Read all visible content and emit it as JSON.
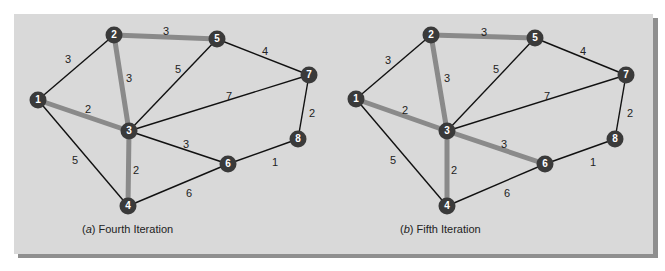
{
  "colors": {
    "panel": "#d9d9d9",
    "tree_edge": "#8a8a8a",
    "edge": "#111111",
    "node": "#3a3a3a"
  },
  "graphs": [
    {
      "caption_letter": "a",
      "caption_text": "Fourth Iteration",
      "nodes": [
        {
          "id": "1",
          "x": 38,
          "y": 100
        },
        {
          "id": "2",
          "x": 114,
          "y": 35
        },
        {
          "id": "3",
          "x": 129,
          "y": 131
        },
        {
          "id": "4",
          "x": 128,
          "y": 206
        },
        {
          "id": "5",
          "x": 217,
          "y": 39
        },
        {
          "id": "6",
          "x": 228,
          "y": 164
        },
        {
          "id": "7",
          "x": 309,
          "y": 75
        },
        {
          "id": "8",
          "x": 298,
          "y": 139
        }
      ],
      "edges": [
        {
          "from": "1",
          "to": "2",
          "w": "3",
          "tree": false,
          "lx": 68,
          "ly": 60
        },
        {
          "from": "1",
          "to": "3",
          "w": "2",
          "tree": true,
          "lx": 88,
          "ly": 110
        },
        {
          "from": "1",
          "to": "4",
          "w": "5",
          "tree": false,
          "lx": 75,
          "ly": 161
        },
        {
          "from": "2",
          "to": "3",
          "w": "3",
          "tree": true,
          "lx": 129,
          "ly": 79
        },
        {
          "from": "2",
          "to": "5",
          "w": "3",
          "tree": true,
          "lx": 166,
          "ly": 32
        },
        {
          "from": "3",
          "to": "5",
          "w": "5",
          "tree": false,
          "lx": 178,
          "ly": 70
        },
        {
          "from": "3",
          "to": "7",
          "w": "7",
          "tree": false,
          "lx": 229,
          "ly": 97
        },
        {
          "from": "3",
          "to": "4",
          "w": "2",
          "tree": true,
          "lx": 136,
          "ly": 171
        },
        {
          "from": "3",
          "to": "6",
          "w": "3",
          "tree": false,
          "lx": 186,
          "ly": 145
        },
        {
          "from": "5",
          "to": "7",
          "w": "4",
          "tree": false,
          "lx": 265,
          "ly": 52
        },
        {
          "from": "7",
          "to": "8",
          "w": "2",
          "tree": false,
          "lx": 312,
          "ly": 114
        },
        {
          "from": "6",
          "to": "8",
          "w": "1",
          "tree": false,
          "lx": 275,
          "ly": 163
        },
        {
          "from": "4",
          "to": "6",
          "w": "6",
          "tree": false,
          "lx": 189,
          "ly": 194
        }
      ],
      "caption_x": 82,
      "caption_y": 230
    },
    {
      "caption_letter": "b",
      "caption_text": "Fifth Iteration",
      "nodes": [
        {
          "id": "1",
          "x": 356,
          "y": 99
        },
        {
          "id": "2",
          "x": 431,
          "y": 35
        },
        {
          "id": "3",
          "x": 447,
          "y": 131
        },
        {
          "id": "4",
          "x": 447,
          "y": 206
        },
        {
          "id": "5",
          "x": 535,
          "y": 38
        },
        {
          "id": "6",
          "x": 545,
          "y": 164
        },
        {
          "id": "7",
          "x": 626,
          "y": 75
        },
        {
          "id": "8",
          "x": 615,
          "y": 139
        }
      ],
      "edges": [
        {
          "from": "1",
          "to": "2",
          "w": "3",
          "tree": false,
          "lx": 388,
          "ly": 61
        },
        {
          "from": "1",
          "to": "3",
          "w": "2",
          "tree": true,
          "lx": 405,
          "ly": 111
        },
        {
          "from": "1",
          "to": "4",
          "w": "5",
          "tree": false,
          "lx": 393,
          "ly": 161
        },
        {
          "from": "2",
          "to": "3",
          "w": "3",
          "tree": true,
          "lx": 447,
          "ly": 79
        },
        {
          "from": "2",
          "to": "5",
          "w": "3",
          "tree": true,
          "lx": 484,
          "ly": 33
        },
        {
          "from": "3",
          "to": "5",
          "w": "5",
          "tree": false,
          "lx": 496,
          "ly": 70
        },
        {
          "from": "3",
          "to": "7",
          "w": "7",
          "tree": false,
          "lx": 547,
          "ly": 97
        },
        {
          "from": "3",
          "to": "4",
          "w": "2",
          "tree": true,
          "lx": 454,
          "ly": 171
        },
        {
          "from": "3",
          "to": "6",
          "w": "3",
          "tree": true,
          "lx": 504,
          "ly": 145
        },
        {
          "from": "5",
          "to": "7",
          "w": "4",
          "tree": false,
          "lx": 583,
          "ly": 52
        },
        {
          "from": "7",
          "to": "8",
          "w": "2",
          "tree": false,
          "lx": 630,
          "ly": 114
        },
        {
          "from": "6",
          "to": "8",
          "w": "1",
          "tree": false,
          "lx": 593,
          "ly": 163
        },
        {
          "from": "4",
          "to": "6",
          "w": "6",
          "tree": false,
          "lx": 507,
          "ly": 194
        }
      ],
      "caption_x": 400,
      "caption_y": 230
    }
  ]
}
